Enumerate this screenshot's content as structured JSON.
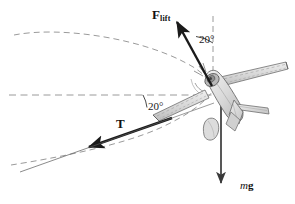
{
  "figure": {
    "background_color": "#ffffff",
    "width": 295,
    "height": 204
  },
  "vectors": [
    {
      "id": "lift",
      "label_main": "F",
      "label_sub": "lift",
      "description": "Lift force vector pointing up and to the left",
      "color": "#1a1a1a",
      "start": [
        212,
        86
      ],
      "end": [
        174,
        19
      ]
    },
    {
      "id": "thrust",
      "label_main": "T",
      "label_sub": "",
      "description": "Thrust / tension vector pointing down and to the left along the wing line",
      "color": "#1a1a1a",
      "start": [
        168,
        119
      ],
      "end": [
        83,
        149
      ]
    },
    {
      "id": "weight",
      "label_main": "mg",
      "label_sub": "",
      "description": "Weight vector pointing straight down",
      "color": "#3a3a3a",
      "start": [
        221,
        96
      ],
      "end": [
        221,
        188
      ]
    }
  ],
  "angles": [
    {
      "id": "angle-lift",
      "value": "20°",
      "description": "Angle between lift vector and vertical dashed reference line"
    },
    {
      "id": "angle-thrust",
      "value": "20°",
      "description": "Angle between thrust vector and horizontal dashed reference line"
    }
  ],
  "guides": {
    "horizontal_dashed_line": {
      "name": "horizontal-reference-line",
      "color": "#9a9a9a",
      "y": 95
    },
    "vertical_dashed_line": {
      "name": "vertical-reference-line",
      "color": "#9a9a9a",
      "x": 213
    },
    "upper_path_arc": {
      "name": "upper-circular-path-arc",
      "color": "#8e8e8e"
    },
    "lower_path_arc": {
      "name": "lower-circular-path-arc",
      "color": "#8e8e8e"
    }
  },
  "aircraft": {
    "name": "banked-airplane-illustration",
    "body_fill": "#dedede",
    "body_stroke": "#6a6a6a",
    "wing_fill": "#d2d2d2",
    "tail_fill": "#d8d8d8",
    "cockpit_fill": "#b8b8b8",
    "description": "Grayscale line-art propeller airplane banked to the right in a circular turn"
  },
  "labels": {
    "lift_sub": "lift",
    "lift_main": "F",
    "thrust": "T",
    "weight_italic": "m",
    "weight_bold": "g"
  }
}
